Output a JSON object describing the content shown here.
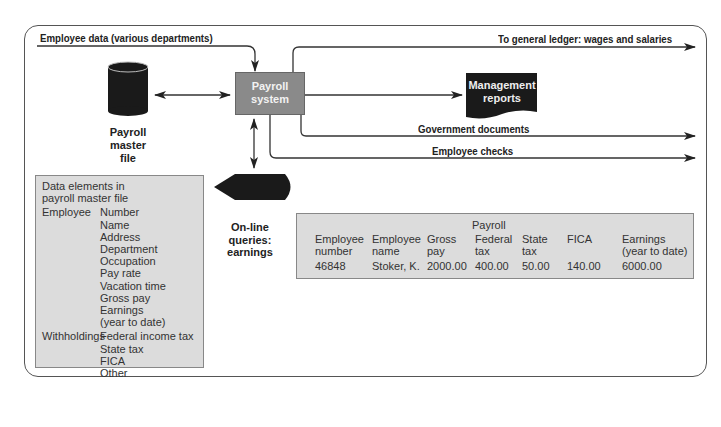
{
  "diagram": {
    "inputs": {
      "employee_data": "Employee data (various departments)"
    },
    "nodes": {
      "payroll_system": "Payroll system",
      "payroll_master_file": [
        "Payroll",
        "master",
        "file"
      ],
      "management_reports": [
        "Management",
        "reports"
      ],
      "online_queries": [
        "On-line",
        "queries:",
        "earnings"
      ]
    },
    "outputs": {
      "general_ledger": "To general ledger: wages and salaries",
      "government_documents": "Government documents",
      "employee_checks": "Employee checks"
    },
    "colors": {
      "process_box": "#8a8a8a",
      "panel": "#dcdcdc",
      "storage": "#1a1a1a"
    }
  },
  "data_elements": {
    "title": [
      "Data elements in",
      "payroll master file"
    ],
    "groups": [
      {
        "label": "Employee",
        "items": [
          "Number",
          "Name",
          "Address",
          "Department",
          "Occupation",
          "Pay rate",
          "Vacation time",
          "Gross pay",
          "Earnings",
          "(year to date)"
        ]
      },
      {
        "label": "Withholdings",
        "items": [
          "Federal income tax",
          "State tax",
          "FICA",
          "Other"
        ]
      }
    ]
  },
  "payroll_record": {
    "title": "Payroll",
    "columns": [
      {
        "h1": "Employee",
        "h2": "number",
        "value": "46848"
      },
      {
        "h1": "Employee",
        "h2": "name",
        "value": "Stoker, K."
      },
      {
        "h1": "Gross",
        "h2": "pay",
        "value": "2000.00"
      },
      {
        "h1": "Federal",
        "h2": "tax",
        "value": "400.00"
      },
      {
        "h1": "State",
        "h2": "tax",
        "value": "50.00"
      },
      {
        "h1": "FICA",
        "h2": "",
        "value": "140.00"
      },
      {
        "h1": "Earnings",
        "h2": "(year to date)",
        "value": "6000.00"
      }
    ]
  }
}
